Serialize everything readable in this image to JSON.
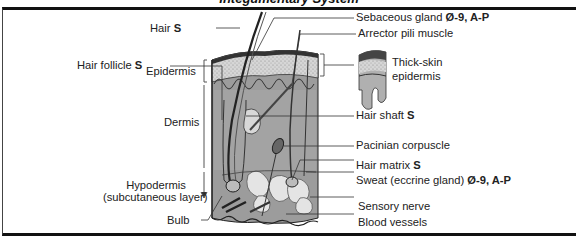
{
  "title": "Integumentary System",
  "diagram": {
    "left_labels": {
      "hair": {
        "text": "Hair ",
        "bold": "S"
      },
      "hair_follicle": {
        "text": "Hair follicle ",
        "bold": "S"
      },
      "epidermis": {
        "text": "Epidermis"
      },
      "dermis": {
        "text": "Dermis"
      },
      "hypodermis_line1": {
        "text": "Hypodermis"
      },
      "hypodermis_line2": {
        "text": "(subcutaneous layer)"
      },
      "bulb": {
        "text": "Bulb"
      }
    },
    "right_labels": {
      "sebaceous_gland": {
        "text": "Sebaceous gland ",
        "bold": "Ø-9, A-P"
      },
      "arrector_pili": {
        "text": "Arrector pili muscle"
      },
      "thick_skin_line1": {
        "text": "Thick-skin"
      },
      "thick_skin_line2": {
        "text": "epidermis"
      },
      "hair_shaft": {
        "text": "Hair shaft ",
        "bold": "S"
      },
      "pacinian_corpuscle": {
        "text": "Pacinian corpuscle"
      },
      "hair_matrix": {
        "text": "Hair matrix ",
        "bold": "S"
      },
      "sweat_gland": {
        "text": "Sweat (eccrine gland) ",
        "bold": "Ø-9, A-P"
      },
      "sensory_nerve": {
        "text": "Sensory nerve"
      },
      "blood_vessels": {
        "text": "Blood vessels"
      }
    }
  }
}
